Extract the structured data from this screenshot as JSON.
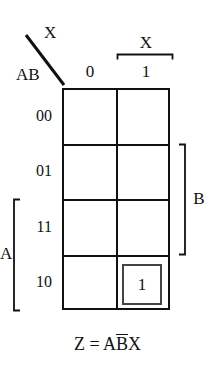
{
  "figure": {
    "type": "karnaugh-map",
    "corner": {
      "column_variable": "X",
      "row_variables": "AB",
      "diagonal": "diagonal-divider"
    },
    "columns": {
      "headers": [
        "0",
        "1"
      ],
      "group_label": "X",
      "group_over_column": "1"
    },
    "rows": {
      "labels": [
        "00",
        "01",
        "11",
        "10"
      ]
    },
    "brackets": [
      {
        "name": "A",
        "label": "A",
        "side": "left",
        "rows": [
          "11",
          "10"
        ]
      },
      {
        "name": "B",
        "label": "B",
        "side": "right",
        "rows": [
          "01",
          "11"
        ]
      }
    ],
    "cells": [
      {
        "row": "00",
        "col": "0",
        "value": ""
      },
      {
        "row": "00",
        "col": "1",
        "value": ""
      },
      {
        "row": "01",
        "col": "0",
        "value": ""
      },
      {
        "row": "01",
        "col": "1",
        "value": ""
      },
      {
        "row": "11",
        "col": "0",
        "value": ""
      },
      {
        "row": "11",
        "col": "1",
        "value": ""
      },
      {
        "row": "10",
        "col": "0",
        "value": ""
      },
      {
        "row": "10",
        "col": "1",
        "value": "1",
        "grouped": true
      }
    ],
    "equation": {
      "lhs": "Z",
      "equals": "=",
      "term_a": "A",
      "term_b_negated": "B",
      "term_x": "X",
      "plain": "Z = AB̄X"
    },
    "colors": {
      "line": "#111111",
      "group_box": "#444444",
      "background": "#ffffff"
    }
  }
}
